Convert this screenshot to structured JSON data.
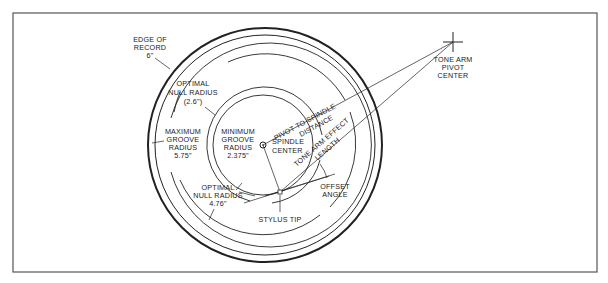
{
  "diagram": {
    "labels": {
      "edge_of_record": [
        "EDGE OF",
        "RECORD",
        "6\""
      ],
      "optimal_null_outer": [
        "OPTIMAL",
        "NULL RADIUS",
        "(2.6\")"
      ],
      "maximum_groove": [
        "MAXIMUM",
        "GROOVE",
        "RADIUS",
        "5.75\""
      ],
      "minimum_groove": [
        "MINIMUM",
        "GROOVE",
        "RADIUS",
        "2.375\""
      ],
      "spindle_center": [
        "SPINDLE",
        "CENTER"
      ],
      "optimal_null_inner": [
        "OPTIMAL",
        "NULL RADIUS",
        "4.76\""
      ],
      "stylus_tip": "STYLUS TIP",
      "offset_angle": [
        "OFFSET",
        "ANGLE"
      ],
      "pivot_to_spindle": [
        "PIVOT TO SPINDLE",
        "DISTANCE"
      ],
      "tone_arm_effect": [
        "TONE ARM EFFECT",
        "LENGTH"
      ],
      "tone_arm_pivot": [
        "TONE ARM",
        "PIVOT",
        "CENTER"
      ]
    },
    "colors": {
      "line": "#222222",
      "frame": "#555555",
      "background": "#ffffff"
    }
  }
}
